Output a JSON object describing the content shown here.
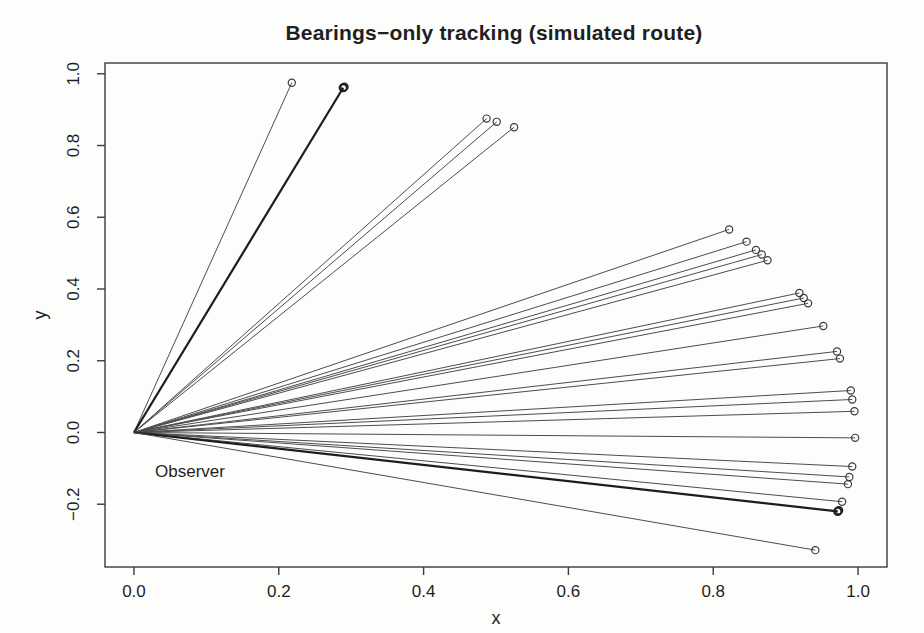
{
  "chart_data": {
    "type": "line",
    "subtype": "bearing-fan",
    "title": "Bearings−only tracking (simulated route)",
    "xlabel": "x",
    "ylabel": "y",
    "xlim": [
      -0.04,
      1.04
    ],
    "ylim": [
      -0.375,
      1.03
    ],
    "grid": false,
    "legend": null,
    "x_ticks": [
      {
        "value": 0.0,
        "label": "0.0"
      },
      {
        "value": 0.2,
        "label": "0.2"
      },
      {
        "value": 0.4,
        "label": "0.4"
      },
      {
        "value": 0.6,
        "label": "0.6"
      },
      {
        "value": 0.8,
        "label": "0.8"
      },
      {
        "value": 1.0,
        "label": "1.0"
      }
    ],
    "y_ticks": [
      {
        "value": 1.0,
        "label": "1.0"
      },
      {
        "value": 0.8,
        "label": "0.8"
      },
      {
        "value": 0.6,
        "label": "0.6"
      },
      {
        "value": 0.4,
        "label": "0.4"
      },
      {
        "value": 0.2,
        "label": "0.2"
      },
      {
        "value": 0.0,
        "label": "0.0"
      },
      {
        "value": -0.2,
        "label": "−0.2"
      }
    ],
    "observer": {
      "x": 0,
      "y": 0,
      "label": "Observer"
    },
    "targets": [
      {
        "x": 0.218,
        "y": 0.975,
        "bold": false
      },
      {
        "x": 0.289,
        "y": 0.961,
        "bold": true
      },
      {
        "x": 0.487,
        "y": 0.875,
        "bold": false
      },
      {
        "x": 0.501,
        "y": 0.866,
        "bold": false
      },
      {
        "x": 0.525,
        "y": 0.851,
        "bold": false
      },
      {
        "x": 0.822,
        "y": 0.566,
        "bold": false
      },
      {
        "x": 0.846,
        "y": 0.532,
        "bold": false
      },
      {
        "x": 0.859,
        "y": 0.509,
        "bold": false
      },
      {
        "x": 0.867,
        "y": 0.496,
        "bold": false
      },
      {
        "x": 0.875,
        "y": 0.48,
        "bold": false
      },
      {
        "x": 0.919,
        "y": 0.389,
        "bold": false
      },
      {
        "x": 0.925,
        "y": 0.375,
        "bold": false
      },
      {
        "x": 0.931,
        "y": 0.36,
        "bold": false
      },
      {
        "x": 0.952,
        "y": 0.297,
        "bold": false
      },
      {
        "x": 0.971,
        "y": 0.226,
        "bold": false
      },
      {
        "x": 0.975,
        "y": 0.206,
        "bold": false
      },
      {
        "x": 0.99,
        "y": 0.117,
        "bold": false
      },
      {
        "x": 0.992,
        "y": 0.092,
        "bold": false
      },
      {
        "x": 0.995,
        "y": 0.059,
        "bold": false
      },
      {
        "x": 0.996,
        "y": -0.015,
        "bold": false
      },
      {
        "x": 0.992,
        "y": -0.095,
        "bold": false
      },
      {
        "x": 0.988,
        "y": -0.124,
        "bold": false
      },
      {
        "x": 0.986,
        "y": -0.144,
        "bold": false
      },
      {
        "x": 0.978,
        "y": -0.193,
        "bold": false
      },
      {
        "x": 0.972,
        "y": -0.22,
        "bold": true
      },
      {
        "x": 0.941,
        "y": -0.328,
        "bold": false
      }
    ],
    "colors": {
      "line": "#4d4d4d",
      "bold_line": "#1c1c1c",
      "marker_stroke": "#3c3c3c",
      "box": "#3a3a3a",
      "text": "#1f1f1f",
      "background": "#fdfdfc"
    }
  }
}
